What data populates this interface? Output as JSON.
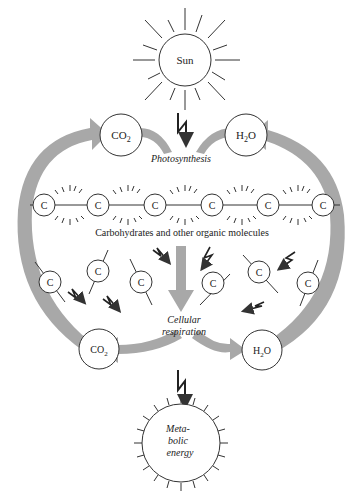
{
  "diagram": {
    "sun": {
      "label": "Sun"
    },
    "top_left_node": {
      "label": "CO",
      "sub": "2"
    },
    "top_right_node": {
      "label": "H",
      "sub": "2",
      "tail": "O"
    },
    "photosynthesis": {
      "label": "Photosynthesis"
    },
    "carbon_chain": {
      "atoms": [
        "C",
        "C",
        "C",
        "C",
        "C",
        "C"
      ],
      "caption": "Carbohydrates and other organic molecules"
    },
    "free_carbons": [
      "C",
      "C",
      "C",
      "C",
      "C",
      "C"
    ],
    "cellular_respiration": {
      "line1": "Cellular",
      "line2": "respiration"
    },
    "bottom_left_node": {
      "label": "CO",
      "sub": "2"
    },
    "bottom_right_node": {
      "label": "H",
      "sub": "2",
      "tail": "O"
    },
    "metabolic_energy": {
      "line1": "Meta-",
      "line2": "bolic",
      "line3": "energy"
    },
    "colors": {
      "arrow": "#a8a8a8",
      "line": "#333333",
      "background": "#ffffff"
    }
  }
}
